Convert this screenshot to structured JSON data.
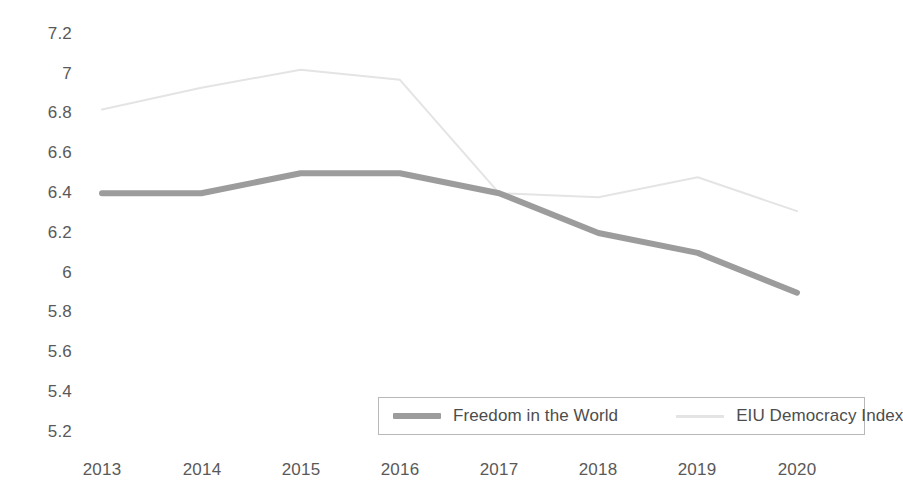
{
  "chart_data": {
    "type": "line",
    "title": "",
    "subtitle": "",
    "xlabel": "",
    "ylabel": "",
    "categories": [
      "2013",
      "2014",
      "2015",
      "2016",
      "2017",
      "2018",
      "2019",
      "2020"
    ],
    "x_tick_labels": [
      "2013",
      "2014",
      "2015",
      "2016",
      "2017",
      "2018",
      "2019",
      "2020"
    ],
    "y_tick_labels": [
      "7.2",
      "7",
      "6.8",
      "6.6",
      "6.4",
      "6.2",
      "6",
      "5.8",
      "5.6",
      "5.4",
      "5.2"
    ],
    "y_tick_values": [
      7.2,
      7,
      6.8,
      6.6,
      6.4,
      6.2,
      6,
      5.8,
      5.6,
      5.4,
      5.2
    ],
    "ylim": [
      5.2,
      7.2
    ],
    "grid": false,
    "legend_position": "bottom",
    "series": [
      {
        "name": "Freedom in the World",
        "color": "#9c9c9c",
        "line_width": 6,
        "values": [
          6.4,
          6.4,
          6.5,
          6.5,
          6.4,
          6.2,
          6.1,
          5.9
        ]
      },
      {
        "name": "EIU Democracy Index",
        "color": "#e4e4e4",
        "line_width": 2,
        "values": [
          6.82,
          6.93,
          7.02,
          6.97,
          6.4,
          6.38,
          6.48,
          6.31
        ]
      }
    ]
  },
  "legend": {
    "entries": [
      {
        "label": "Freedom in the World"
      },
      {
        "label": "EIU Democracy Index"
      }
    ]
  },
  "colors": {
    "freedom_line": "#9c9c9c",
    "eiu_line": "#e4e4e4",
    "axis_text": "#595959",
    "legend_border": "#b8b8b8",
    "background": "#ffffff"
  }
}
